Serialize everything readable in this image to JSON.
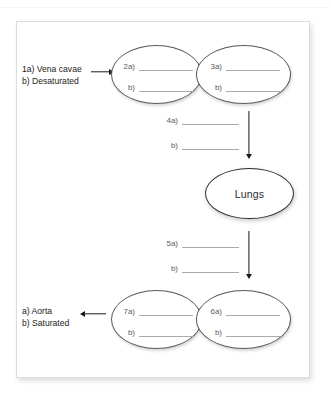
{
  "page": {
    "background_color": "#ffffff",
    "card_border_color": "#dcdcdf"
  },
  "diagram": {
    "title_text": "",
    "ink_color": "#1d1d20",
    "oval_stroke": "#56565a",
    "blank_line_color": "#a9a9ae",
    "nodes": [
      {
        "id": "node-2-3-pair",
        "ovals": [
          {
            "id": "oval-2",
            "kind": "blanks",
            "rows": [
              {
                "label": "2a)",
                "value": ""
              },
              {
                "label": "b)",
                "value": ""
              }
            ]
          },
          {
            "id": "oval-3",
            "kind": "blanks",
            "rows": [
              {
                "label": "3a)",
                "value": ""
              },
              {
                "label": "b)",
                "value": ""
              }
            ]
          }
        ]
      },
      {
        "id": "oval-lungs",
        "kind": "text",
        "text": "Lungs"
      },
      {
        "id": "node-7-6-pair",
        "ovals": [
          {
            "id": "oval-7",
            "kind": "blanks",
            "rows": [
              {
                "label": "7a)",
                "value": ""
              },
              {
                "label": "b)",
                "value": ""
              }
            ]
          },
          {
            "id": "oval-6",
            "kind": "blanks",
            "rows": [
              {
                "label": "6a)",
                "value": ""
              },
              {
                "label": "b)",
                "value": ""
              }
            ]
          }
        ]
      }
    ],
    "blank_blocks": [
      {
        "id": "block-4",
        "rows": [
          {
            "label": "4a)",
            "value": ""
          },
          {
            "label": "b)",
            "value": ""
          }
        ]
      },
      {
        "id": "block-5",
        "rows": [
          {
            "label": "5a)",
            "value": ""
          },
          {
            "label": "b)",
            "value": ""
          }
        ]
      }
    ],
    "side_labels": [
      {
        "id": "label-inflow",
        "line1": "1a) Vena cavae",
        "line2": "b) Desaturated"
      },
      {
        "id": "label-outflow",
        "line1": "a) Aorta",
        "line2": "b) Saturated"
      }
    ],
    "arrows": [
      {
        "id": "arrow-inflow",
        "direction": "right"
      },
      {
        "id": "arrow-to-lungs",
        "direction": "down"
      },
      {
        "id": "arrow-from-lungs",
        "direction": "down"
      },
      {
        "id": "arrow-outflow",
        "direction": "left"
      }
    ]
  }
}
